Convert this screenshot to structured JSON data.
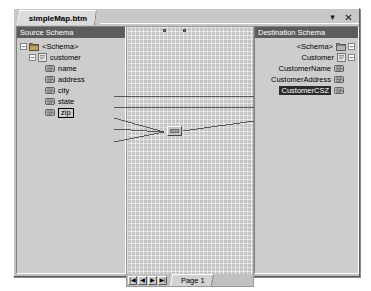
{
  "window": {
    "document_tab": "simpleMap.btm",
    "minimize_label": "▾",
    "close_label": "✕"
  },
  "source_pane": {
    "header": "Source Schema",
    "nodes": [
      {
        "label": "<Schema>",
        "icon": "folder-icon",
        "expander": "−",
        "depth": 0
      },
      {
        "label": "customer",
        "icon": "record-icon",
        "expander": "−",
        "depth": 1
      },
      {
        "label": "name",
        "icon": "field-icon",
        "expander": "",
        "depth": 2
      },
      {
        "label": "address",
        "icon": "field-icon",
        "expander": "",
        "depth": 2
      },
      {
        "label": "city",
        "icon": "field-icon",
        "expander": "",
        "depth": 2
      },
      {
        "label": "state",
        "icon": "field-icon",
        "expander": "",
        "depth": 2
      },
      {
        "label": "zip",
        "icon": "field-icon",
        "expander": "",
        "depth": 2
      }
    ]
  },
  "dest_pane": {
    "header": "Destination Schema",
    "nodes": [
      {
        "label": "<Schema>",
        "icon": "folder-icon",
        "expander": "−",
        "selected": false
      },
      {
        "label": "Customer",
        "icon": "record-icon",
        "expander": "−",
        "selected": false
      },
      {
        "label": "CustomerName",
        "icon": "field-icon",
        "expander": "",
        "selected": false
      },
      {
        "label": "CustomerAddress",
        "icon": "field-icon",
        "expander": "",
        "selected": false
      },
      {
        "label": "CustomerCSZ",
        "icon": "field-icon",
        "expander": "",
        "selected": true
      }
    ]
  },
  "canvas": {
    "functoid_name": "concatenate-functoid",
    "links": [
      {
        "from": "name",
        "to": "CustomerName"
      },
      {
        "from": "address",
        "to": "CustomerAddress"
      },
      {
        "from": "city",
        "to": "functoid"
      },
      {
        "from": "state",
        "to": "functoid"
      },
      {
        "from": "zip",
        "to": "functoid"
      },
      {
        "from": "functoid",
        "to": "CustomerCSZ"
      }
    ]
  },
  "pagebar": {
    "first_label": "|◀",
    "prev_label": "◀",
    "next_label": "▶",
    "last_label": "▶|",
    "page_tab": "Page 1"
  },
  "colors": {
    "window_face": "#c0c0c0",
    "pane_header_bg": "#5c5c5c",
    "pane_body_bg": "#cdcdcd",
    "canvas_bg": "#c5c5c5",
    "selection_bg": "#2a2a2a",
    "link_line": "#4a4a4a"
  }
}
